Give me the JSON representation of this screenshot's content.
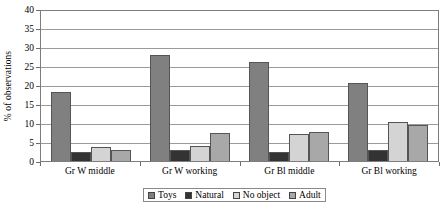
{
  "chart_data": {
    "type": "bar",
    "title": "",
    "xlabel": "",
    "ylabel": "% of observations",
    "ylim": [
      0,
      40
    ],
    "ytick_step": 5,
    "yticks": [
      0,
      5,
      10,
      15,
      20,
      25,
      30,
      35,
      40
    ],
    "ytick_labels": [
      "0",
      "5",
      "10",
      "15",
      "20",
      "25",
      "30",
      "35",
      "40"
    ],
    "grid": true,
    "legend_position": "bottom",
    "categories": [
      "Gr W middle",
      "Gr W working",
      "Gr Bl middle",
      "Gr Bl working"
    ],
    "series": [
      {
        "name": "Toys",
        "color": "#808080",
        "values": [
          18.2,
          28.0,
          26.0,
          20.4
        ]
      },
      {
        "name": "Natural",
        "color": "#333333",
        "values": [
          2.4,
          3.0,
          2.4,
          3.0
        ]
      },
      {
        "name": "No object",
        "color": "#d4d4d4",
        "values": [
          3.7,
          4.0,
          7.0,
          10.2
        ]
      },
      {
        "name": "Adult",
        "color": "#a8a8a8",
        "values": [
          3.0,
          7.5,
          7.7,
          9.5
        ]
      }
    ]
  }
}
